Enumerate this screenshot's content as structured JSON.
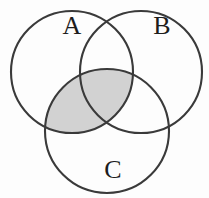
{
  "figure": {
    "type": "venn-diagram",
    "background_color": "#fdfdfd",
    "stroke_color": "#3a3a3a",
    "shade_color": "#d2d2d2",
    "label_color": "#1d1d1d"
  },
  "chart_data": {
    "type": "diagram",
    "title": "",
    "sets": [
      {
        "id": "A",
        "label": "A",
        "cx": 72,
        "cy": 72,
        "r": 61,
        "label_x": 72,
        "label_y": 28
      },
      {
        "id": "B",
        "label": "B",
        "cx": 141,
        "cy": 72,
        "r": 61,
        "label_x": 162,
        "label_y": 28
      },
      {
        "id": "C",
        "label": "C",
        "cx": 107,
        "cy": 131,
        "r": 62,
        "label_x": 113,
        "label_y": 172
      }
    ],
    "shaded_regions": [
      {
        "expression": "A and C",
        "includes_triple_overlap": true,
        "fill": "#d2d2d2"
      }
    ],
    "unshaded_regions": [
      "A only",
      "B only",
      "C only",
      "A and B only",
      "B and C only"
    ]
  },
  "labels": {
    "a": "A",
    "b": "B",
    "c": "C"
  }
}
